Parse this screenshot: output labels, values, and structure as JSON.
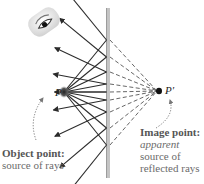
{
  "diagram": {
    "object_point": {
      "symbol": "P",
      "heading": "Object point:",
      "description": "source of rays"
    },
    "image_point": {
      "symbol": "P′",
      "heading": "Image point:",
      "description_italic": "apparent",
      "description_line2": "source of",
      "description_line3": "reflected rays"
    },
    "eye_icon": "eye-icon",
    "mirror": "plane-mirror",
    "reflection_heights": [
      -52,
      -35,
      -20,
      -8,
      0,
      8,
      20,
      36,
      53
    ],
    "colors": {
      "ray": "#2b2b2b",
      "virtual_ray": "#555555",
      "mirror": "#b8b8b8",
      "label": "#6b6b6b"
    }
  }
}
